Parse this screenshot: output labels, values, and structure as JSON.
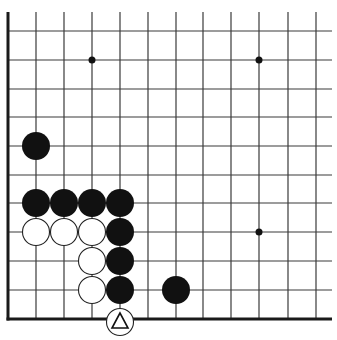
{
  "board": {
    "title": "Go problem diagram",
    "colors": {
      "background": "#ffffff",
      "line": "#3a3a3a",
      "border": "#1a1a1a",
      "black_stone": "#111111",
      "white_stone": "#ffffff",
      "stone_outline": "#222222"
    },
    "columns_x": [
      8,
      36,
      64,
      92,
      120,
      148,
      176,
      203,
      231,
      259,
      288,
      316
    ],
    "rows_y": [
      31,
      60,
      89,
      117,
      146,
      175,
      203,
      232,
      261,
      290,
      319
    ],
    "line_top": 12,
    "line_right": 332,
    "edges": [
      "left",
      "bottom"
    ],
    "star_points": [
      {
        "col": 3,
        "row": 1
      },
      {
        "col": 9,
        "row": 1
      },
      {
        "col": 9,
        "row": 7
      }
    ],
    "stones": [
      {
        "color": "black",
        "col": 1,
        "row": 4
      },
      {
        "color": "black",
        "col": 1,
        "row": 6
      },
      {
        "color": "black",
        "col": 2,
        "row": 6
      },
      {
        "color": "black",
        "col": 3,
        "row": 6
      },
      {
        "color": "black",
        "col": 4,
        "row": 6
      },
      {
        "color": "white",
        "col": 1,
        "row": 7
      },
      {
        "color": "white",
        "col": 2,
        "row": 7
      },
      {
        "color": "white",
        "col": 3,
        "row": 7
      },
      {
        "color": "black",
        "col": 4,
        "row": 7
      },
      {
        "color": "white",
        "col": 3,
        "row": 8
      },
      {
        "color": "black",
        "col": 4,
        "row": 8
      },
      {
        "color": "white",
        "col": 3,
        "row": 9
      },
      {
        "color": "black",
        "col": 4,
        "row": 9
      },
      {
        "color": "black",
        "col": 6,
        "row": 9
      },
      {
        "color": "white",
        "col": 4,
        "row": 10,
        "marker": "triangle",
        "offset_y": 3
      }
    ],
    "stone_radius": 14
  }
}
